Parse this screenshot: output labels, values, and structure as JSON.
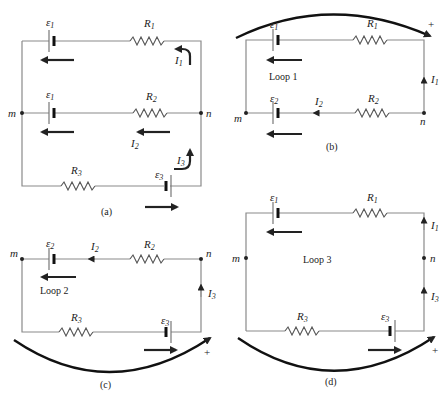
{
  "panels": {
    "a": {
      "caption": "(a)",
      "labels": {
        "emf1_top": "ε",
        "emf1_top_sub": "1",
        "emf1_mid": "ε",
        "emf1_mid_sub": "1",
        "emf3": "ε",
        "emf3_sub": "3",
        "R1": "R",
        "R1_sub": "1",
        "R2": "R",
        "R2_sub": "2",
        "R3": "R",
        "R3_sub": "3",
        "I1": "I",
        "I1_sub": "1",
        "I2": "I",
        "I2_sub": "2",
        "I3": "I",
        "I3_sub": "3",
        "node_m": "m",
        "node_n": "n"
      }
    },
    "b": {
      "caption": "(b)",
      "loop_label": "Loop 1",
      "plus": "+",
      "labels": {
        "emf1": "ε",
        "emf1_sub": "1",
        "emf2": "ε",
        "emf2_sub": "2",
        "R1": "R",
        "R1_sub": "1",
        "R2": "R",
        "R2_sub": "2",
        "I1": "I",
        "I1_sub": "1",
        "I2": "I",
        "I2_sub": "2",
        "node_m": "m",
        "node_n": "n"
      }
    },
    "c": {
      "caption": "(c)",
      "loop_label": "Loop 2",
      "plus": "+",
      "labels": {
        "emf2": "ε",
        "emf2_sub": "2",
        "emf3": "ε",
        "emf3_sub": "3",
        "R2": "R",
        "R2_sub": "2",
        "R3": "R",
        "R3_sub": "3",
        "I2": "I",
        "I2_sub": "2",
        "I3": "I",
        "I3_sub": "3",
        "node_m": "m",
        "node_n": "n"
      }
    },
    "d": {
      "caption": "(d)",
      "loop_label": "Loop 3",
      "plus": "+",
      "labels": {
        "emf1": "ε",
        "emf1_sub": "1",
        "emf3": "ε",
        "emf3_sub": "3",
        "R1": "R",
        "R1_sub": "1",
        "R3": "R",
        "R3_sub": "3",
        "I1": "I",
        "I1_sub": "1",
        "I3": "I",
        "I3_sub": "3",
        "node_m": "m",
        "node_n": "n"
      }
    }
  }
}
